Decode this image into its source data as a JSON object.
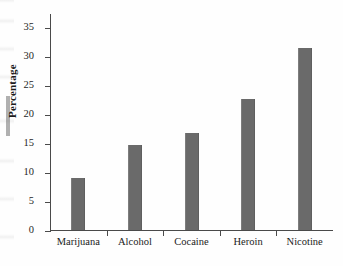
{
  "chart_data": {
    "type": "bar",
    "title": "",
    "xlabel": "",
    "ylabel": "Percentage",
    "categories": [
      "Marijuana",
      "Alcohol",
      "Cocaine",
      "Heroin",
      "Nicotine"
    ],
    "values": [
      9.0,
      14.7,
      16.7,
      22.7,
      31.5
    ],
    "ylim": [
      0,
      37.5
    ],
    "yticks": [
      0,
      5,
      10,
      15,
      20,
      25,
      30,
      35
    ],
    "ytick_labels": [
      "0",
      "5",
      "10",
      "15",
      "20",
      "25",
      "30",
      "35"
    ],
    "grid": false,
    "legend": null,
    "bar_color": "#6a6a6a",
    "axis_color": "#4a4a4a",
    "text_color": "#1b1b1b",
    "background_color": "#fefefe"
  },
  "axis": {
    "y_title": "Percentage"
  }
}
